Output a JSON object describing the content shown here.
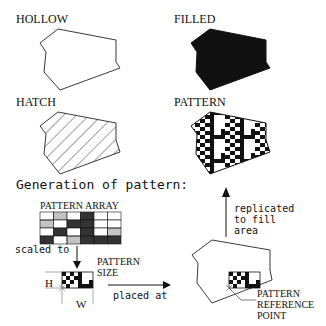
{
  "figure": {
    "panels": [
      {
        "id": "hollow",
        "label": "HOLLOW",
        "fill": "none"
      },
      {
        "id": "filled",
        "label": "FILLED",
        "fill": "solid"
      },
      {
        "id": "hatch",
        "label": "HATCH",
        "fill": "diagonal-hatch"
      },
      {
        "id": "pattern",
        "label": "PATTERN",
        "fill": "pattern"
      }
    ],
    "generation": {
      "title": "Generation of pattern:",
      "array_label": "PATTERN ARRAY",
      "array_grid": [
        [
          "white",
          "hatch",
          "white",
          "dark",
          "white",
          "white"
        ],
        [
          "hatch",
          "white",
          "dark",
          "dark",
          "white",
          "white"
        ],
        [
          "white",
          "dark",
          "white",
          "dark",
          "white",
          "hatch"
        ],
        [
          "dark",
          "white",
          "hatch",
          "dark",
          "dark",
          "dark"
        ]
      ],
      "scaled_label": "scaled to",
      "size_label_1": "PATTERN",
      "size_label_2": "SIZE",
      "h_label": "H",
      "w_label": "W",
      "placed_label": "placed at",
      "replicated_1": "replicated",
      "replicated_2": "to fill",
      "replicated_3": "area",
      "ref_1": "PATTERN",
      "ref_2": "REFERENCE",
      "ref_3": "POINT"
    },
    "colors": {
      "ink": "#111111",
      "dark_cell": "#333333",
      "background": "#ffffff"
    }
  }
}
